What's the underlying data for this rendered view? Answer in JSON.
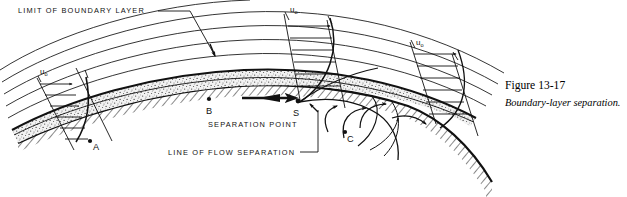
{
  "figure": {
    "domain": "technical-diagram",
    "title_label": "LIMIT OF BOUNDARY LAYER",
    "separation_point_label": "SEPARATION POINT",
    "flow_separation_label": "LINE OF FLOW SEPARATION",
    "point_labels": {
      "a": "A",
      "b": "B",
      "s": "S",
      "c": "C"
    },
    "velocity_labels": [
      {
        "id": "u0-left",
        "symbol": "u",
        "subscript": "o"
      },
      {
        "id": "u0-middle",
        "symbol": "u",
        "subscript": "o"
      },
      {
        "id": "u0-right",
        "symbol": "u",
        "subscript": "o"
      }
    ],
    "caption": {
      "number": "Figure 13-17",
      "text": "Boundary-layer separation."
    },
    "colors": {
      "ink": "#111111",
      "background": "#ffffff",
      "boundary_layer_fill": "#efefef",
      "stipple": "#4a4a4a"
    }
  }
}
